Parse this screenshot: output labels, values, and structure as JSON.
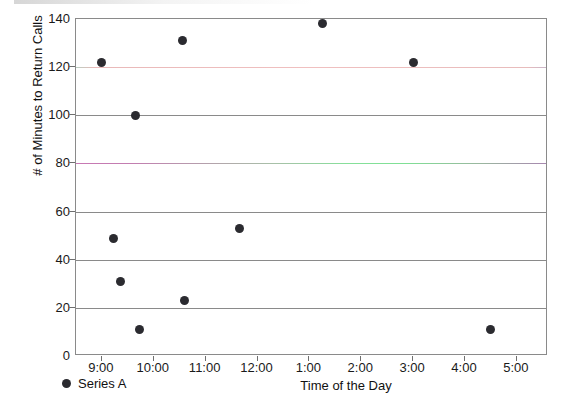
{
  "chart_data": {
    "type": "scatter",
    "title": "",
    "xlabel": "Time of the Day",
    "ylabel": "# of Minutes to Return Calls",
    "ylim": [
      0,
      140
    ],
    "ytick_labels": [
      "0",
      "20",
      "40",
      "60",
      "80",
      "100",
      "120",
      "140"
    ],
    "ytick_values": [
      0,
      20,
      40,
      60,
      80,
      100,
      120,
      140
    ],
    "xtick_labels": [
      "9:00",
      "10:00",
      "11:00",
      "12:00",
      "1:00",
      "2:00",
      "3:00",
      "4:00",
      "5:00"
    ],
    "xtick_values": [
      9,
      10,
      11,
      12,
      13,
      14,
      15,
      16,
      17
    ],
    "xlim": [
      8.5,
      17.6
    ],
    "grid": "horizontal",
    "legend_position": "bottom-left",
    "series": [
      {
        "name": "Series A",
        "marker": "circle",
        "color": "#2b2b30",
        "points": [
          {
            "x": 9.0,
            "y": 122,
            "label": "9:00"
          },
          {
            "x": 9.22,
            "y": 49,
            "label": "9:13"
          },
          {
            "x": 9.35,
            "y": 31,
            "label": "9:21"
          },
          {
            "x": 9.65,
            "y": 100,
            "label": "9:39"
          },
          {
            "x": 9.72,
            "y": 11,
            "label": "9:43"
          },
          {
            "x": 10.55,
            "y": 131,
            "label": "10:33"
          },
          {
            "x": 10.6,
            "y": 23,
            "label": "10:36"
          },
          {
            "x": 11.65,
            "y": 53,
            "label": "11:39"
          },
          {
            "x": 13.25,
            "y": 138,
            "label": "1:15"
          },
          {
            "x": 15.0,
            "y": 122,
            "label": "3:00"
          },
          {
            "x": 16.5,
            "y": 11,
            "label": "4:30"
          }
        ]
      }
    ],
    "reference_lines": [
      {
        "y": 120,
        "color": "#f0c0c0",
        "name": "reference-line-120"
      },
      {
        "y": 80,
        "color": "#86e09a",
        "name": "reference-line-80"
      }
    ]
  },
  "legend": {
    "items": [
      {
        "label": "Series A",
        "color": "#2b2b30"
      }
    ]
  }
}
